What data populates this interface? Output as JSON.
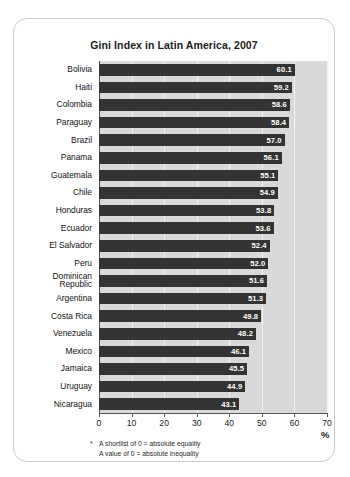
{
  "chart_data": {
    "type": "bar",
    "orientation": "horizontal",
    "title": "Gini Index in Latin America, 2007",
    "xlabel": "%",
    "ylabel": "",
    "xlim": [
      0,
      70
    ],
    "xticks": [
      0,
      10,
      20,
      30,
      40,
      50,
      60,
      70
    ],
    "grid": true,
    "legend": false,
    "categories": [
      "Bolivia",
      "Haiti",
      "Colombia",
      "Paraguay",
      "Brazil",
      "Panama",
      "Guatemala",
      "Chile",
      "Honduras",
      "Ecuador",
      "El Salvador",
      "Peru",
      "Dominican\nRepublic",
      "Argentina",
      "Costa Rica",
      "Venezuela",
      "Mexico",
      "Jamaica",
      "Uruguay",
      "Nicaragua"
    ],
    "values": [
      60.1,
      59.2,
      58.6,
      58.4,
      57.0,
      56.1,
      55.1,
      54.9,
      53.8,
      53.6,
      52.4,
      52.0,
      51.6,
      51.3,
      49.8,
      48.2,
      46.1,
      45.5,
      44.9,
      43.1
    ],
    "value_labels": [
      "60.1",
      "59.2",
      "58.6",
      "58.4",
      "57.0",
      "56.1",
      "55.1",
      "54.9",
      "53.8",
      "53.6",
      "52.4",
      "52.0",
      "51.6",
      "51.3",
      "49.8",
      "48.2",
      "46.1",
      "45.5",
      "44.9",
      "43.1"
    ],
    "annotations": [
      "* A shortlist of 0 = absolute equality",
      "A value of 0 = absolute inequality"
    ],
    "colors": {
      "bar": "#333333",
      "plot_background": "#d9d9d9",
      "gridline": "#f2f2f2",
      "axis": "#555555",
      "value_text": "#ffffff",
      "card_border": "#c9c9c9"
    }
  },
  "footnotes": {
    "marker": "*",
    "line1": "A shortlist of 0 = absolute equality",
    "line2": "A value of 0 = absolute inequality"
  }
}
